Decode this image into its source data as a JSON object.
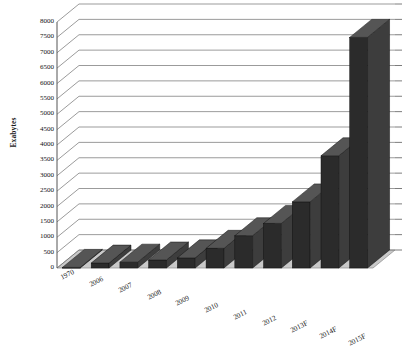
{
  "chart_data": {
    "type": "bar",
    "title": "",
    "subtitle": "",
    "xlabel": "",
    "ylabel": "Exabytes",
    "ylim": [
      0,
      8000
    ],
    "ytick_step": 500,
    "yticks": [
      0,
      500,
      1000,
      1500,
      2000,
      2500,
      3000,
      3500,
      4000,
      4500,
      5000,
      5500,
      6000,
      6500,
      7000,
      7500,
      8000
    ],
    "ytick_labels": [
      "0",
      "500",
      "1000",
      "1500",
      "2000",
      "2500",
      "3000",
      "3500",
      "4000",
      "4500",
      "5000",
      "5500",
      "6000",
      "6500",
      "7000",
      "7500",
      "8000"
    ],
    "categories": [
      "1970",
      "2006",
      "2007",
      "2008",
      "2009",
      "2010",
      "2011",
      "2012",
      "2013F",
      "2014F",
      "2015F"
    ],
    "values": [
      20,
      160,
      190,
      260,
      330,
      640,
      1050,
      1450,
      2150,
      3650,
      7500
    ],
    "grid": true,
    "legend": false,
    "legend_position": "none",
    "style": "3d-column",
    "bar_color": "#2b2b2b",
    "bar_side_color": "#3d3d3d",
    "bar_top_color": "#555555",
    "floor_color": "#c9c9c9",
    "wall_color": "#ffffff",
    "grid_color": "#707070",
    "axis_color": "#555555"
  },
  "axes": {
    "y_title": "Exabytes"
  }
}
